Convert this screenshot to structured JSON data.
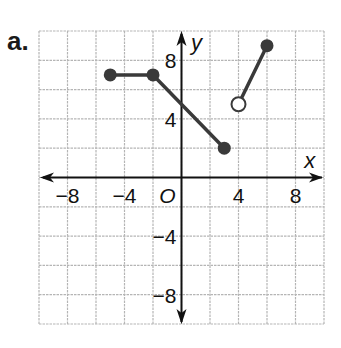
{
  "problem_label": "a.",
  "chart_data": {
    "type": "line",
    "title": "",
    "xlabel": "x",
    "ylabel": "y",
    "origin_label": "O",
    "xlim": [
      -10,
      10
    ],
    "ylim": [
      -10,
      10
    ],
    "grid": true,
    "grid_step": 2,
    "x_ticks": [
      -8,
      -4,
      4,
      8
    ],
    "y_ticks": [
      8,
      4,
      -4,
      -8
    ],
    "x_tick_labels": [
      "−8",
      "−4",
      "4",
      "8"
    ],
    "y_tick_labels": [
      "8",
      "4",
      "−4",
      "−8"
    ],
    "segments": [
      {
        "from": {
          "x": -5,
          "y": 7,
          "closed": true
        },
        "to": {
          "x": -2,
          "y": 7,
          "closed": true
        }
      },
      {
        "from": {
          "x": -2,
          "y": 7,
          "closed": true
        },
        "to": {
          "x": 3,
          "y": 2,
          "closed": true
        }
      },
      {
        "from": {
          "x": 4,
          "y": 5,
          "closed": false
        },
        "to": {
          "x": 6,
          "y": 9,
          "closed": true
        }
      }
    ],
    "colors": {
      "segment": "#3a3a3a",
      "axis": "#111111",
      "grid": "#b5b5b5",
      "open_fill": "#ffffff"
    }
  }
}
